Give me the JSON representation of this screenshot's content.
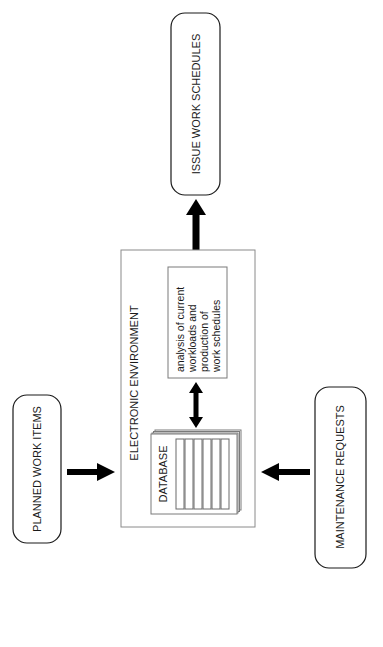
{
  "diagram": {
    "terminals": {
      "issue_work_schedules": "ISSUE WORK SCHEDULES",
      "planned_work_items": "PLANNED WORK ITEMS",
      "maintenance_requests": "MAINTENANCE REQUESTS"
    },
    "environment": {
      "title": "ELECTRONIC ENVIRONMENT",
      "database_label": "DATABASE",
      "analysis_lines": [
        "analysis of current",
        "workloads and",
        "production of",
        "work schedules"
      ]
    },
    "colors": {
      "line": "#1a1a1a",
      "container_border": "#8a8a8a",
      "arrow": "#000000",
      "background": "#ffffff"
    }
  }
}
